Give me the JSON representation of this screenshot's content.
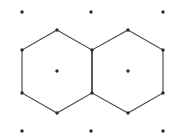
{
  "figure": {
    "background_color": "#ffffff",
    "width": 176,
    "height": 137
  },
  "style": {
    "edge_color": "#4d4d4d",
    "edge_width": 1.15,
    "vertex_color": "#2b2b2b",
    "vertex_radius": 1.7,
    "center_dot_color": "#2b2b2b",
    "center_dot_radius": 1.7,
    "lattice_dot_color": "#2b2b2b",
    "lattice_dot_radius": 1.7
  },
  "chart_data": {
    "type": "scatter",
    "xlabel": "",
    "ylabel": "",
    "xlim": [
      0,
      176
    ],
    "ylim": [
      0,
      137
    ],
    "grid": false,
    "legend": "none",
    "shapes": [
      {
        "name": "left-hexagon",
        "kind": "polygon",
        "points": "57,30 92,50 92,93 57,113 22,93 22,50",
        "center": [
          57,
          71
        ]
      },
      {
        "name": "right-hexagon",
        "kind": "polygon",
        "points": "128,30 163,50 163,93 128,113 92,93 92,50",
        "center": [
          128,
          71
        ]
      }
    ],
    "shared_edge": {
      "name": "shared-edge",
      "from": [
        92,
        50
      ],
      "to": [
        92,
        93
      ]
    },
    "vertices": [
      [
        57,
        30
      ],
      [
        92,
        50
      ],
      [
        92,
        93
      ],
      [
        57,
        113
      ],
      [
        22,
        93
      ],
      [
        22,
        50
      ],
      [
        128,
        30
      ],
      [
        163,
        50
      ],
      [
        163,
        93
      ],
      [
        128,
        113
      ]
    ],
    "centers": [
      [
        57,
        71
      ],
      [
        128,
        71
      ]
    ],
    "lattice_points": [
      [
        22,
        12
      ],
      [
        91,
        12
      ],
      [
        163,
        12
      ],
      [
        22,
        131
      ],
      [
        91,
        131
      ],
      [
        163,
        131
      ]
    ]
  }
}
